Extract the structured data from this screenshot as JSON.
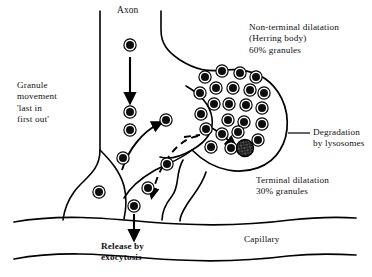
{
  "figure": {
    "title_text_blocks": {
      "axon": "Axon",
      "granule_movement": "Granule\nmovement\n'last in\nfirst out'",
      "non_terminal_dilatation": "Non-terminal dilatation\n(Herring body)\n60% granules",
      "degradation": "Degradation\nby lysosomes",
      "terminal_dilatation": "Terminal dilatation\n30% granules",
      "release": "Release by\nexocytosis",
      "capillary": "Capillary"
    },
    "colors": {
      "ink": "#000000",
      "background": "#ffffff",
      "granule_core": "#0d0d0d",
      "granule_ring": "#ffffff",
      "granule_outline": "#000000",
      "lysosome_fill": "#2b2b2b"
    },
    "percentages": {
      "non_terminal_granules": "60%",
      "terminal_granules": "30%"
    },
    "granules_axon_column": [
      {
        "cx": 130,
        "cy": 45
      },
      {
        "cx": 130,
        "cy": 112
      },
      {
        "cx": 130,
        "cy": 130
      }
    ],
    "granules_terminal_path": [
      {
        "cx": 123,
        "cy": 158
      },
      {
        "cx": 99,
        "cy": 192
      },
      {
        "cx": 134,
        "cy": 206
      },
      {
        "cx": 148,
        "cy": 188
      },
      {
        "cx": 166,
        "cy": 120
      },
      {
        "cx": 167,
        "cy": 164
      }
    ],
    "granules_herring_body": [
      {
        "cx": 205,
        "cy": 77
      },
      {
        "cx": 222,
        "cy": 71
      },
      {
        "cx": 240,
        "cy": 73
      },
      {
        "cx": 256,
        "cy": 77
      },
      {
        "cx": 200,
        "cy": 93
      },
      {
        "cx": 216,
        "cy": 88
      },
      {
        "cx": 233,
        "cy": 88
      },
      {
        "cx": 250,
        "cy": 90
      },
      {
        "cx": 264,
        "cy": 93
      },
      {
        "cx": 214,
        "cy": 104
      },
      {
        "cx": 229,
        "cy": 104
      },
      {
        "cx": 246,
        "cy": 105
      },
      {
        "cx": 262,
        "cy": 108
      },
      {
        "cx": 201,
        "cy": 114
      },
      {
        "cx": 228,
        "cy": 120
      },
      {
        "cx": 244,
        "cy": 122
      },
      {
        "cx": 262,
        "cy": 124
      },
      {
        "cx": 206,
        "cy": 129
      },
      {
        "cx": 222,
        "cy": 134
      },
      {
        "cx": 238,
        "cy": 132
      },
      {
        "cx": 258,
        "cy": 140
      },
      {
        "cx": 211,
        "cy": 147
      },
      {
        "cx": 231,
        "cy": 148
      }
    ],
    "lysosome_granule": {
      "cx": 245,
      "cy": 148,
      "r": 8.5
    },
    "arrows": [
      {
        "name": "axon-descending-arrow",
        "style": "solid"
      },
      {
        "name": "transport-up-arrow",
        "style": "solid"
      },
      {
        "name": "return-dashed-arrow",
        "style": "dashed"
      },
      {
        "name": "degradation-arrow",
        "style": "solid"
      },
      {
        "name": "exocytosis-arrow",
        "style": "solid"
      }
    ]
  }
}
